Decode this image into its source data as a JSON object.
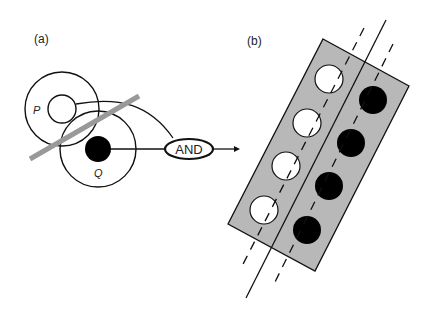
{
  "panel_a": {
    "label": "(a)",
    "circle_p_label": "P",
    "circle_q_label": "Q",
    "gate_label": "AND"
  },
  "panel_b": {
    "label": "(b)",
    "white_dots": 4,
    "black_dots": 4
  },
  "colors": {
    "stroke": "#111111",
    "gray_bar": "#999999",
    "rect_fill": "#b8b8b8",
    "black_dot": "#000000",
    "white_dot": "#ffffff"
  }
}
